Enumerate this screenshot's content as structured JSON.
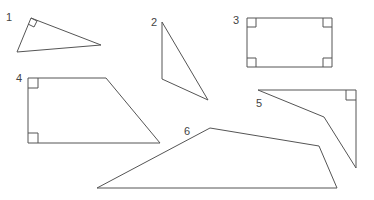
{
  "diagram": {
    "title": "",
    "stroke_color": "#555555",
    "label_color": "#444444",
    "shapes": [
      {
        "label": "1",
        "label_pos": [
          6,
          12
        ],
        "kind": "right triangle",
        "points": "31,18 17,52 101,45",
        "right_angle_markers": [
          "M31,18 L37,21 L34,27 L28,24"
        ]
      },
      {
        "label": "2",
        "label_pos": [
          151,
          17
        ],
        "kind": "triangle",
        "points": "162,22 162,79 208,100",
        "right_angle_markers": []
      },
      {
        "label": "3",
        "label_pos": [
          233,
          15
        ],
        "kind": "rectangle",
        "points": "247,18 332,18 332,67 247,67",
        "right_angle_markers": [
          "M247,27 L256,27 L256,18",
          "M332,27 L323,27 L323,18",
          "M247,58 L256,58 L256,67",
          "M332,58 L323,58 L323,67"
        ]
      },
      {
        "label": "4",
        "label_pos": [
          16,
          73
        ],
        "kind": "right trapezoid",
        "points": "28,78 106,78 160,143 28,143",
        "right_angle_markers": [
          "M28,88 L38,88 L38,78",
          "M28,133 L38,133 L38,143"
        ]
      },
      {
        "label": "5",
        "label_pos": [
          256,
          98
        ],
        "kind": "quadrilateral",
        "points": "258,90 356,90 356,168 324,117",
        "right_angle_markers": [
          "M346,90 L346,100 L356,100"
        ]
      },
      {
        "label": "6",
        "label_pos": [
          184,
          126
        ],
        "kind": "quadrilateral",
        "points": "97,188 210,128 319,146 337,188",
        "right_angle_markers": []
      }
    ]
  }
}
